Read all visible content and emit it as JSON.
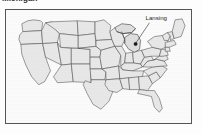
{
  "figure": {
    "title": "Michigan",
    "title_clipped": true,
    "kind": "choropleth-outline-map",
    "region": "United States (contiguous 48 states)"
  },
  "map": {
    "border_color": "#555555",
    "state_fill": "#e8e8e8",
    "state_outline": "#4a4a4a",
    "background": "#fbfbfb",
    "highlight_state": "Michigan",
    "highlight_fill": "#dedede"
  },
  "annotations": [
    {
      "id": "lansing",
      "label": "Lansing",
      "type": "city-capital-marker",
      "marker_color": "#1a1a1a",
      "leader_line": true,
      "state": "Michigan"
    }
  ],
  "legend": {
    "present": false
  }
}
